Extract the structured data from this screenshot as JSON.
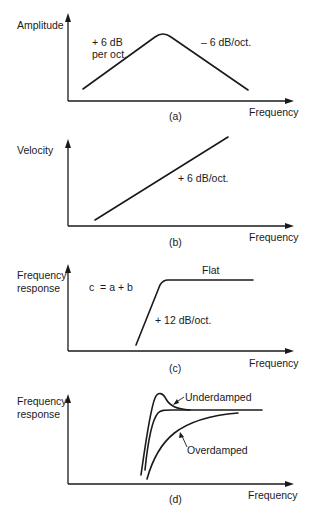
{
  "panels": [
    {
      "id": "a",
      "caption": "(a)",
      "y_axis_label_lines": [
        "Amplitude"
      ],
      "x_axis_label": "Frequency",
      "annotations": {
        "left_slope_lines": [
          "+ 6 dB",
          "per oct."
        ],
        "right_slope": "– 6 dB/oct."
      },
      "curve": "rise +6 dB/oct to a peak then fall -6 dB/oct"
    },
    {
      "id": "b",
      "caption": "(b)",
      "y_axis_label_lines": [
        "Velocity"
      ],
      "x_axis_label": "Frequency",
      "annotations": {
        "slope": "+ 6 dB/oct."
      },
      "curve": "straight rising line"
    },
    {
      "id": "c",
      "caption": "(c)",
      "y_axis_label_lines": [
        "Frequency",
        "response"
      ],
      "x_axis_label": "Frequency",
      "annotations": {
        "equation": "c  = a + b",
        "flat": "Flat",
        "slope": "+ 12 dB/oct."
      },
      "curve": "steep +12 dB/oct rise then flat"
    },
    {
      "id": "d",
      "caption": "(d)",
      "y_axis_label_lines": [
        "Frequency",
        "response"
      ],
      "x_axis_label": "Frequency",
      "annotations": {
        "underdamped": "Underdamped",
        "overdamped": "Overdamped"
      },
      "curves": [
        "underdamped (overshoot peak)",
        "critically damped",
        "overdamped (slow approach)"
      ]
    }
  ]
}
